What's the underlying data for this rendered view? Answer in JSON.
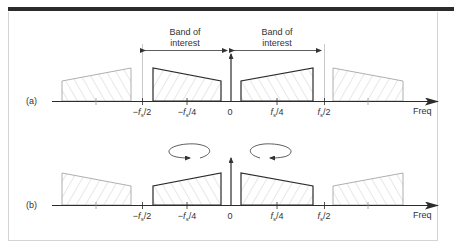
{
  "figure": {
    "panel_a": {
      "label": "(a)",
      "band_left_label_line1": "Band of",
      "band_left_label_line2": "interest",
      "band_right_label_line1": "Band of",
      "band_right_label_line2": "interest"
    },
    "panel_b": {
      "label": "(b)"
    },
    "axis": {
      "x_label": "Freq",
      "ticks": [
        {
          "label_prefix": "−",
          "symbol": "f",
          "sub": "s",
          "suffix": "/2"
        },
        {
          "label_prefix": "−",
          "symbol": "f",
          "sub": "s",
          "suffix": "/4"
        },
        {
          "label_prefix": "",
          "symbol": "0",
          "sub": "",
          "suffix": ""
        },
        {
          "label_prefix": "",
          "symbol": "f",
          "sub": "s",
          "suffix": "/4"
        },
        {
          "label_prefix": "",
          "symbol": "f",
          "sub": "s",
          "suffix": "/2"
        }
      ]
    },
    "colors": {
      "dark_line": "#2b2b2b",
      "faded_line": "#9a9a9a",
      "hatch": "#c4c4c4",
      "frame": "#cfcfcf"
    }
  }
}
